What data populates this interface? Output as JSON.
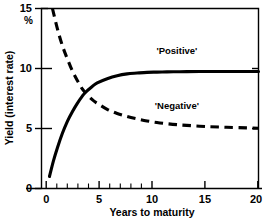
{
  "chart_data": {
    "type": "line",
    "title": "",
    "xlabel": "Years to maturity",
    "ylabel": "Yield (interest rate)",
    "yunit": "%",
    "xlim": [
      -0.6,
      21.2
    ],
    "ylim": [
      0,
      15
    ],
    "grid": false,
    "legend_position": "inline-annotation",
    "xticks": [
      0,
      5,
      10,
      15,
      20
    ],
    "xtick_labels": [
      "0",
      "5",
      "10",
      "15",
      "20"
    ],
    "xminor_ticks": [
      1,
      2,
      3,
      4,
      6,
      7,
      8,
      9
    ],
    "yticks": [
      0,
      5,
      10,
      15
    ],
    "ytick_labels": [
      "0",
      "5",
      "10",
      "15"
    ],
    "series": [
      {
        "name": "'Positive'",
        "style": "solid",
        "color": "#000000",
        "annotation": "'Positive'",
        "annotation_x": 13.0,
        "annotation_y": 11.2,
        "x": [
          0.2,
          0.6,
          1.0,
          1.5,
          2.0,
          2.5,
          3.0,
          3.5,
          3.8,
          4.5,
          5.0,
          6.0,
          7.0,
          8.0,
          9.0,
          10.0,
          11.0,
          12.0,
          13.0,
          14.0,
          16.0,
          18.0,
          20.0,
          21.2
        ],
        "y": [
          1.0,
          2.3,
          3.4,
          4.6,
          5.6,
          6.4,
          7.1,
          7.7,
          8.0,
          8.5,
          8.8,
          9.15,
          9.4,
          9.55,
          9.62,
          9.68,
          9.7,
          9.72,
          9.73,
          9.74,
          9.75,
          9.75,
          9.75,
          9.75
        ]
      },
      {
        "name": "'Negative'",
        "style": "dashed",
        "color": "#000000",
        "annotation": "'Negative'",
        "annotation_x": 13.0,
        "annotation_y": 6.6,
        "x": [
          0.5,
          1.0,
          1.5,
          2.0,
          2.5,
          3.0,
          3.5,
          3.8,
          4.5,
          5.0,
          6.0,
          7.0,
          8.0,
          9.0,
          10.0,
          11.0,
          12.0,
          13.0,
          14.0,
          16.0,
          18.0,
          20.0,
          21.2
        ],
        "y": [
          15.0,
          13.3,
          11.9,
          10.8,
          9.8,
          9.0,
          8.3,
          8.0,
          7.4,
          7.1,
          6.6,
          6.25,
          6.0,
          5.8,
          5.63,
          5.5,
          5.4,
          5.32,
          5.26,
          5.16,
          5.1,
          5.05,
          5.02
        ]
      }
    ],
    "crossing_point": {
      "x": 3.8,
      "y": 8.0
    }
  },
  "axes": {
    "y_axis_title": "Yield (interest rate)",
    "y_unit": "%",
    "x_axis_title": "Years to maturity"
  },
  "labels": {
    "positive": "'Positive'",
    "negative": "'Negative'"
  },
  "colors": {
    "background": "#ffffff",
    "ink": "#000000",
    "frame": "#000000"
  }
}
